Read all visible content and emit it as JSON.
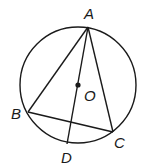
{
  "diagram": {
    "type": "geometry",
    "circle": {
      "center": "O",
      "cx": 78,
      "cy": 85,
      "r": 58
    },
    "points": {
      "A": {
        "label": "A",
        "x": 88,
        "y": 27,
        "label_x": 84,
        "label_y": 19
      },
      "B": {
        "label": "B",
        "x": 28,
        "y": 112,
        "label_x": 11,
        "label_y": 119
      },
      "C": {
        "label": "C",
        "x": 113,
        "y": 132,
        "label_x": 114,
        "label_y": 148
      },
      "D": {
        "label": "D",
        "x": 67,
        "y": 144,
        "label_x": 61,
        "label_y": 163
      },
      "O": {
        "label": "O",
        "x": 78,
        "y": 85,
        "label_x": 84,
        "label_y": 101
      }
    },
    "segments": [
      "AB",
      "AC",
      "BC",
      "AD"
    ],
    "colors": {
      "stroke": "#1a1a1a",
      "background": "#ffffff"
    }
  }
}
